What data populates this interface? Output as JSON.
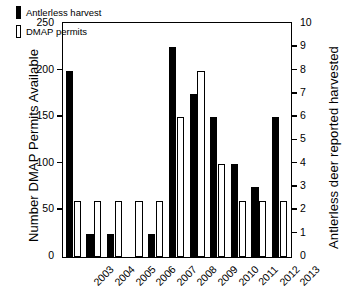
{
  "chart_data": {
    "type": "bar",
    "title": "",
    "subtitle": "",
    "xlabel": "",
    "ylabel": "Number DMAP Permits Available",
    "ylabel_secondary": "Antlerless deer reported harvested",
    "categories": [
      "2003",
      "2004",
      "2005",
      "2006",
      "2007",
      "2008",
      "2009",
      "2010",
      "2011",
      "2012",
      "2013"
    ],
    "series": [
      {
        "name": "Antlerless harvest",
        "axis": "left",
        "fill": "#000000",
        "style": "filled",
        "values": [
          200,
          25,
          25,
          0,
          25,
          225,
          175,
          150,
          100,
          75,
          150
        ]
      },
      {
        "name": "DMAP permits",
        "axis": "right",
        "fill": "#ffffff",
        "style": "outline",
        "values": [
          2.4,
          2.4,
          2.4,
          2.4,
          2.4,
          6.0,
          8.0,
          4.0,
          2.4,
          2.4,
          2.4
        ]
      }
    ],
    "ylim": [
      0,
      250
    ],
    "ylim_secondary": [
      0,
      10
    ],
    "yticks": [
      0,
      50,
      100,
      150,
      200,
      250
    ],
    "yticks_secondary": [
      0,
      1,
      2,
      3,
      4,
      5,
      6,
      7,
      8,
      9,
      10
    ],
    "grid": false,
    "legend_position": "top-left",
    "legend": [
      {
        "label": "Antlerless harvest",
        "swatch": "filled-black"
      },
      {
        "label": "DMAP permits",
        "swatch": "outline-white"
      }
    ]
  }
}
